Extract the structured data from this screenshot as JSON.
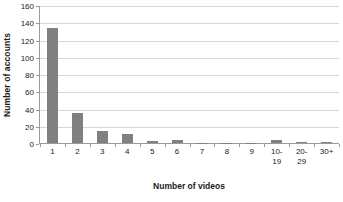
{
  "chart_data": {
    "type": "bar",
    "title": "",
    "xlabel": "Number of videos",
    "ylabel": "Number of accounts",
    "categories": [
      "1",
      "2",
      "3",
      "4",
      "5",
      "6",
      "7",
      "8",
      "9",
      "10-\n19",
      "20-\n29",
      "30+"
    ],
    "category_labels": [
      {
        "line1": "1",
        "line2": ""
      },
      {
        "line1": "2",
        "line2": ""
      },
      {
        "line1": "3",
        "line2": ""
      },
      {
        "line1": "4",
        "line2": ""
      },
      {
        "line1": "5",
        "line2": ""
      },
      {
        "line1": "6",
        "line2": ""
      },
      {
        "line1": "7",
        "line2": ""
      },
      {
        "line1": "8",
        "line2": ""
      },
      {
        "line1": "9",
        "line2": ""
      },
      {
        "line1": "10-",
        "line2": "19"
      },
      {
        "line1": "20-",
        "line2": "29"
      },
      {
        "line1": "30+",
        "line2": ""
      }
    ],
    "values": [
      134,
      35,
      14,
      10,
      2,
      3,
      0.5,
      0.5,
      0.3,
      4,
      1,
      1
    ],
    "ylim": [
      0,
      160
    ],
    "ytick_step": 20,
    "yticks": [
      160,
      140,
      120,
      100,
      80,
      60,
      40,
      20,
      0
    ],
    "grid": true,
    "legend": false,
    "bar_color": "#808080",
    "gridline_color": "#d6d6d6",
    "axis_color": "#9a9a9a",
    "text_color": "#1a1a1a",
    "background": "#ffffff"
  }
}
